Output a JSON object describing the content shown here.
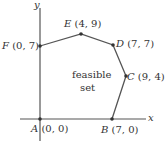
{
  "diagram": {
    "type": "feasible-region",
    "axes": {
      "x_label": "x",
      "y_label": "y"
    },
    "region_label_line1": "feasible",
    "region_label_line2": "set",
    "points": [
      {
        "name": "A",
        "coords": "(0, 0)"
      },
      {
        "name": "B",
        "coords": "(7, 0)"
      },
      {
        "name": "C",
        "coords": "(9, 4)"
      },
      {
        "name": "D",
        "coords": "(7, 7)"
      },
      {
        "name": "E",
        "coords": "(4, 9)"
      },
      {
        "name": "F",
        "coords": "(0, 7)"
      }
    ],
    "colors": {
      "line": "#555555",
      "axis": "#555555",
      "text": "#333333"
    }
  }
}
